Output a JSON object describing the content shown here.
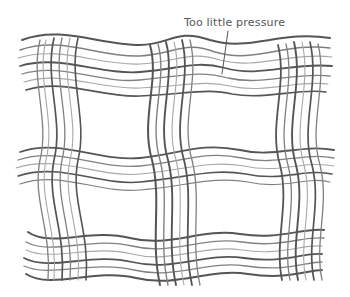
{
  "illustration": {
    "subject": "wavy plaid pencil sketch",
    "annotation": {
      "label": "Too little pressure"
    },
    "colors": {
      "background": "#ffffff",
      "pencil_dark": "#555555",
      "pencil_mid": "#808080",
      "pencil_light": "#a8a8a8"
    }
  }
}
